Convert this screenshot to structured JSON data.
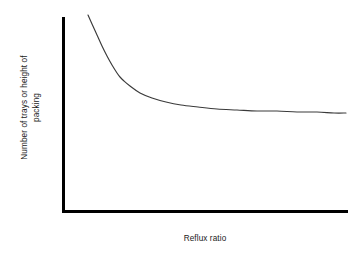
{
  "chart_data": {
    "type": "line",
    "title": "",
    "subtitle": "",
    "xlabel": "Reflux ratio",
    "ylabel_line1": "Number of trays or height of",
    "ylabel_line2": "packing",
    "ylabel": "Number of trays or height of packing",
    "grid": false,
    "legend": false,
    "legend_position": "none",
    "xticks": [],
    "yticks": [],
    "xtick_labels": [],
    "ytick_labels": [],
    "xlim": [
      0,
      1
    ],
    "ylim": [
      0,
      1
    ],
    "axis_color": "#000000",
    "curve_color": "#3a3a3a",
    "background_color": "#ffffff",
    "series": [
      {
        "name": "trays vs reflux ratio",
        "note": "Monotonically decreasing hyperbolic curve; steep near minimum reflux, asymptotically flat at large reflux ratio",
        "x": [
          0.091,
          0.104,
          0.12,
          0.136,
          0.152,
          0.168,
          0.185,
          0.196,
          0.21,
          0.231,
          0.266,
          0.308,
          0.357,
          0.409,
          0.469,
          0.535,
          0.605,
          0.675,
          0.745,
          0.815,
          0.885,
          0.944,
          0.993
        ],
        "y": [
          1.0,
          0.908,
          0.8,
          0.694,
          0.597,
          0.513,
          0.437,
          0.398,
          0.363,
          0.315,
          0.252,
          0.2,
          0.161,
          0.133,
          0.11,
          0.093,
          0.08,
          0.072,
          0.066,
          0.061,
          0.057,
          0.053,
          0.052
        ]
      }
    ],
    "points_px": [
      [
        88,
        15
      ],
      [
        92,
        24
      ],
      [
        97,
        35
      ],
      [
        102,
        46
      ],
      [
        107,
        56
      ],
      [
        112,
        65
      ],
      [
        117,
        73
      ],
      [
        120,
        77
      ],
      [
        124,
        81
      ],
      [
        130,
        86
      ],
      [
        140,
        93
      ],
      [
        152,
        98
      ],
      [
        166,
        102
      ],
      [
        181,
        105
      ],
      [
        198,
        107
      ],
      [
        217,
        109
      ],
      [
        237,
        110
      ],
      [
        257,
        111
      ],
      [
        277,
        111
      ],
      [
        297,
        112
      ],
      [
        317,
        112
      ],
      [
        334,
        113
      ],
      [
        346,
        113
      ]
    ]
  },
  "accessibility": {
    "figure_role": "chart"
  }
}
